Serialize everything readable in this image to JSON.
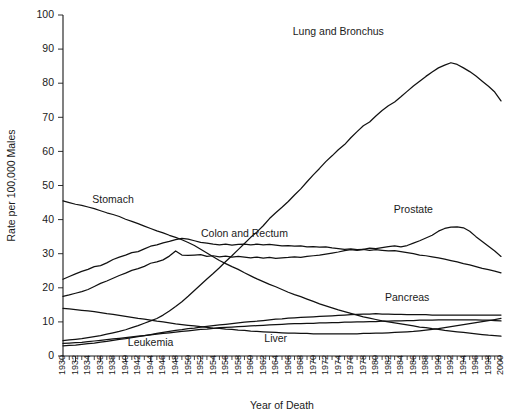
{
  "chart_data": {
    "type": "line",
    "title": "",
    "xlabel": "Year of Death",
    "ylabel": "Rate per 100,000 Males",
    "xlim": [
      1930,
      2000
    ],
    "ylim": [
      0,
      100
    ],
    "yticks": [
      0,
      10,
      20,
      30,
      40,
      50,
      60,
      70,
      80,
      90,
      100
    ],
    "grid": false,
    "legend_position": "inline-labels",
    "x": [
      1930,
      1931,
      1932,
      1933,
      1934,
      1935,
      1936,
      1937,
      1938,
      1939,
      1940,
      1941,
      1942,
      1943,
      1944,
      1945,
      1946,
      1947,
      1948,
      1949,
      1950,
      1951,
      1952,
      1953,
      1954,
      1955,
      1956,
      1957,
      1958,
      1959,
      1960,
      1961,
      1962,
      1963,
      1964,
      1965,
      1966,
      1967,
      1968,
      1969,
      1970,
      1971,
      1972,
      1973,
      1974,
      1975,
      1976,
      1977,
      1978,
      1979,
      1980,
      1981,
      1982,
      1983,
      1984,
      1985,
      1986,
      1987,
      1988,
      1989,
      1990,
      1991,
      1992,
      1993,
      1994,
      1995,
      1996,
      1997,
      1998,
      1999,
      2000
    ],
    "xtick_labels": [
      "1930",
      "1932",
      "1934",
      "1936",
      "1938",
      "1940",
      "1942",
      "1944",
      "1946",
      "1948",
      "1950",
      "1952",
      "1954",
      "1956",
      "1958",
      "1960",
      "1962",
      "1964",
      "1966",
      "1968",
      "1970",
      "1972",
      "1974",
      "1976",
      "1978",
      "1980",
      "1982",
      "1984",
      "1986",
      "1988",
      "1990",
      "1992",
      "1994",
      "1996",
      "1998",
      "2000"
    ],
    "series": [
      {
        "name": "Lung and Bronchus",
        "label_x": 1974,
        "label_y": 94,
        "values": [
          4.5,
          4.7,
          4.9,
          5.1,
          5.4,
          5.7,
          6.0,
          6.4,
          6.8,
          7.2,
          7.7,
          8.3,
          8.9,
          9.6,
          10.3,
          11.0,
          12.0,
          13.2,
          14.5,
          15.9,
          17.5,
          19.2,
          20.9,
          22.6,
          24.2,
          25.9,
          27.7,
          29.4,
          31.2,
          33.0,
          34.8,
          36.4,
          38.2,
          40.3,
          42.0,
          43.6,
          45.3,
          47.2,
          49.0,
          51.1,
          53.1,
          55.0,
          57.0,
          58.7,
          60.5,
          62.0,
          64.0,
          65.8,
          67.5,
          68.6,
          70.4,
          72.0,
          73.4,
          74.5,
          76.0,
          77.6,
          79.2,
          80.6,
          82.0,
          83.3,
          84.5,
          85.3,
          86.0,
          85.5,
          84.5,
          83.4,
          82.1,
          80.6,
          79.1,
          77.4,
          74.8
        ]
      },
      {
        "name": "Stomach",
        "label_x": 1938,
        "label_y": 45,
        "values": [
          45.5,
          45.0,
          44.5,
          44.2,
          43.7,
          43.2,
          42.6,
          42.0,
          41.5,
          40.9,
          40.1,
          39.5,
          38.8,
          38.1,
          37.4,
          36.7,
          36.1,
          35.4,
          34.8,
          34.1,
          33.3,
          32.4,
          31.3,
          30.2,
          29.1,
          28.0,
          27.1,
          26.2,
          25.4,
          24.4,
          23.5,
          22.6,
          21.8,
          21.0,
          20.3,
          19.5,
          18.7,
          18.0,
          17.4,
          16.7,
          16.0,
          15.3,
          14.7,
          14.1,
          13.5,
          13.0,
          12.5,
          12.0,
          11.5,
          11.1,
          10.7,
          10.3,
          10.0,
          9.7,
          9.4,
          9.1,
          8.8,
          8.5,
          8.3,
          8.0,
          7.8,
          7.5,
          7.3,
          7.1,
          6.9,
          6.7,
          6.5,
          6.3,
          6.1,
          6.0,
          5.8
        ]
      },
      {
        "name": "Colon and Rectum",
        "label_x": 1959,
        "label_y": 35,
        "values": [
          22.5,
          23.3,
          24.1,
          24.8,
          25.4,
          26.2,
          26.5,
          27.3,
          28.3,
          29.0,
          29.6,
          30.3,
          30.6,
          31.4,
          32.2,
          32.6,
          33.2,
          33.6,
          34.1,
          34.5,
          34.3,
          33.8,
          33.3,
          33.1,
          32.8,
          32.6,
          32.8,
          32.5,
          32.7,
          32.8,
          32.6,
          32.8,
          32.6,
          32.7,
          32.5,
          32.3,
          32.4,
          32.2,
          32.3,
          32.0,
          32.1,
          31.9,
          32.0,
          31.7,
          31.5,
          31.3,
          31.4,
          31.2,
          31.3,
          31.0,
          31.2,
          31.0,
          30.8,
          30.9,
          30.6,
          30.3,
          30.0,
          29.6,
          29.4,
          29.1,
          28.8,
          28.4,
          28.0,
          27.6,
          27.1,
          26.7,
          26.2,
          25.7,
          25.3,
          24.9,
          24.4
        ]
      },
      {
        "name": "Prostate",
        "label_x": 1986,
        "label_y": 42,
        "values": [
          17.5,
          17.9,
          18.4,
          18.9,
          19.5,
          20.4,
          21.3,
          22.0,
          22.8,
          23.6,
          24.3,
          25.1,
          25.6,
          26.3,
          27.2,
          27.6,
          28.2,
          29.3,
          30.8,
          29.6,
          29.5,
          29.6,
          29.7,
          29.2,
          29.4,
          29.1,
          29.3,
          29.0,
          29.2,
          29.0,
          28.8,
          29.0,
          28.7,
          28.9,
          28.6,
          28.8,
          28.9,
          29.1,
          28.9,
          29.2,
          29.4,
          29.6,
          29.9,
          30.2,
          30.5,
          30.9,
          31.2,
          31.0,
          31.3,
          31.6,
          31.5,
          31.8,
          32.1,
          32.3,
          32.0,
          32.4,
          33.1,
          33.8,
          34.6,
          35.4,
          36.6,
          37.4,
          37.8,
          37.9,
          37.6,
          36.6,
          35.0,
          33.6,
          32.2,
          30.8,
          29.2
        ]
      },
      {
        "name": "Pancreas",
        "label_x": 1985,
        "label_y": 16,
        "values": [
          3.0,
          3.1,
          3.2,
          3.4,
          3.6,
          3.8,
          4.1,
          4.3,
          4.6,
          4.9,
          5.1,
          5.4,
          5.7,
          6.0,
          6.3,
          6.6,
          6.9,
          7.2,
          7.5,
          7.7,
          8.0,
          8.2,
          8.5,
          8.7,
          8.9,
          9.1,
          9.3,
          9.5,
          9.7,
          9.9,
          10.1,
          10.2,
          10.4,
          10.6,
          10.8,
          10.9,
          11.1,
          11.2,
          11.3,
          11.4,
          11.5,
          11.6,
          11.7,
          11.8,
          11.9,
          12.0,
          12.1,
          12.2,
          12.3,
          12.3,
          12.4,
          12.3,
          12.3,
          12.2,
          12.2,
          12.1,
          12.1,
          12.1,
          12.1,
          12.0,
          12.0,
          12.0,
          12.0,
          12.0,
          12.0,
          12.0,
          12.0,
          12.0,
          12.0,
          12.0,
          12.0
        ]
      },
      {
        "name": "Leukemia",
        "label_x": 1944,
        "label_y": 3.0,
        "values": [
          3.7,
          3.8,
          3.9,
          4.0,
          4.2,
          4.4,
          4.6,
          4.8,
          5.0,
          5.2,
          5.4,
          5.6,
          5.8,
          6.0,
          6.2,
          6.4,
          6.6,
          6.8,
          7.0,
          7.2,
          7.4,
          7.6,
          7.8,
          7.9,
          8.1,
          8.3,
          8.4,
          8.5,
          8.6,
          8.7,
          8.8,
          8.9,
          9.0,
          9.1,
          9.2,
          9.3,
          9.4,
          9.5,
          9.5,
          9.6,
          9.6,
          9.7,
          9.7,
          9.8,
          9.8,
          9.9,
          9.9,
          10.0,
          10.0,
          10.1,
          10.1,
          10.2,
          10.2,
          10.3,
          10.3,
          10.4,
          10.4,
          10.5,
          10.5,
          10.5,
          10.6,
          10.6,
          10.6,
          10.6,
          10.6,
          10.6,
          10.6,
          10.5,
          10.5,
          10.4,
          10.3
        ]
      },
      {
        "name": "Liver",
        "label_x": 1964,
        "label_y": 4.0,
        "values": [
          14.0,
          13.8,
          13.6,
          13.4,
          13.2,
          13.0,
          12.7,
          12.4,
          12.2,
          11.9,
          11.6,
          11.3,
          11.0,
          10.8,
          10.5,
          10.2,
          10.0,
          9.7,
          9.4,
          9.2,
          9.0,
          8.8,
          8.6,
          8.4,
          8.2,
          8.1,
          7.9,
          7.8,
          7.6,
          7.5,
          7.3,
          7.2,
          7.1,
          7.0,
          6.9,
          6.8,
          6.7,
          6.7,
          6.6,
          6.6,
          6.5,
          6.5,
          6.5,
          6.5,
          6.5,
          6.5,
          6.5,
          6.5,
          6.6,
          6.6,
          6.7,
          6.7,
          6.8,
          6.9,
          7.0,
          7.1,
          7.2,
          7.4,
          7.6,
          7.8,
          8.0,
          8.3,
          8.6,
          8.9,
          9.2,
          9.5,
          9.8,
          10.1,
          10.4,
          10.7,
          11.0
        ]
      }
    ]
  }
}
